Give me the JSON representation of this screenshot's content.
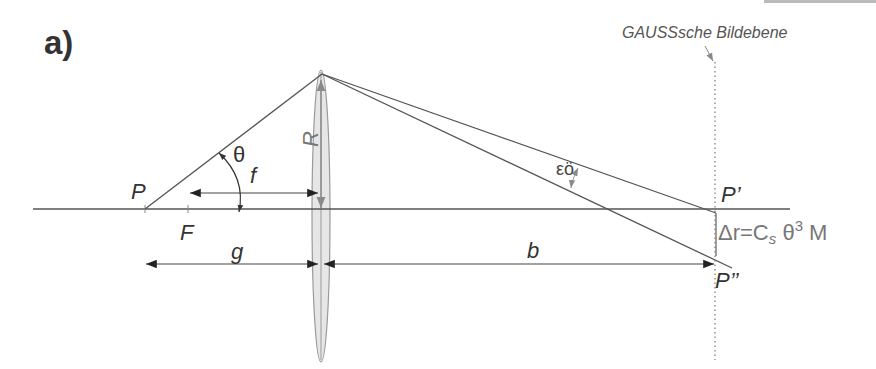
{
  "figure": {
    "panel_label": "a)",
    "image_plane_label": "GAUSSsche Bildebene",
    "labels": {
      "object_point": "P",
      "focal_point": "F",
      "angle": "θ",
      "focal_length": "f",
      "lens_radius": "R",
      "object_distance": "g",
      "image_distance": "b",
      "paraxial_image_point": "P’",
      "aberrated_image_point": "P’’",
      "aberration_angle": "εö"
    },
    "equation": {
      "prefix": "Δr=C",
      "subscript": "s",
      "theta": " θ",
      "superscript": "3",
      "suffix": " M"
    },
    "colors": {
      "line": "#555555",
      "lens_fill": "#e6e6e6",
      "lens_stroke": "#9a9a9a",
      "arrow_dark": "#222222",
      "grey_arrow": "#8a8a8a",
      "text": "#333333"
    }
  }
}
